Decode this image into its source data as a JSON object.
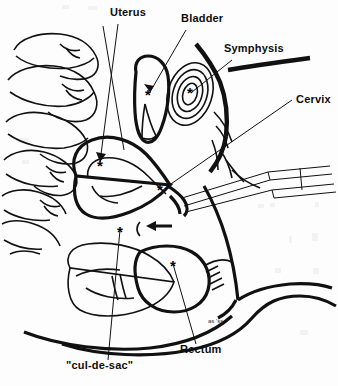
{
  "figure": {
    "background_color": "#fdfdfd",
    "ink_color": "#111111",
    "width": 338,
    "height": 386,
    "signature": "as 'ss"
  },
  "labels": [
    {
      "id": "uterus",
      "text": "Uterus",
      "x": 110,
      "y": 16,
      "anchor": "start"
    },
    {
      "id": "bladder",
      "text": "Bladder",
      "x": 181,
      "y": 22,
      "anchor": "start"
    },
    {
      "id": "symphysis",
      "text": "Symphysis",
      "x": 224,
      "y": 52,
      "anchor": "start"
    },
    {
      "id": "cervix",
      "text": "Cervix",
      "x": 296,
      "y": 103,
      "anchor": "start"
    },
    {
      "id": "rectum",
      "text": "Rectum",
      "x": 180,
      "y": 353,
      "anchor": "start"
    },
    {
      "id": "cul-de-sac",
      "text": "\"cul-de-sac\"",
      "x": 66,
      "y": 369,
      "anchor": "start"
    }
  ],
  "markers": [
    {
      "id": "marker-bladder",
      "glyph": "*",
      "x": 148,
      "y": 95
    },
    {
      "id": "marker-symphysis",
      "glyph": "*",
      "x": 190,
      "y": 93
    },
    {
      "id": "marker-uterus",
      "glyph": "*",
      "x": 100,
      "y": 166
    },
    {
      "id": "marker-cervix",
      "glyph": "*",
      "x": 160,
      "y": 190
    },
    {
      "id": "marker-cul-de-sac",
      "glyph": "*",
      "x": 120,
      "y": 232
    },
    {
      "id": "marker-rectum",
      "glyph": "*",
      "x": 173,
      "y": 266
    }
  ],
  "annotations": {
    "arrow_label": "directional-arrow",
    "instrument_label": "speculum-probe"
  }
}
